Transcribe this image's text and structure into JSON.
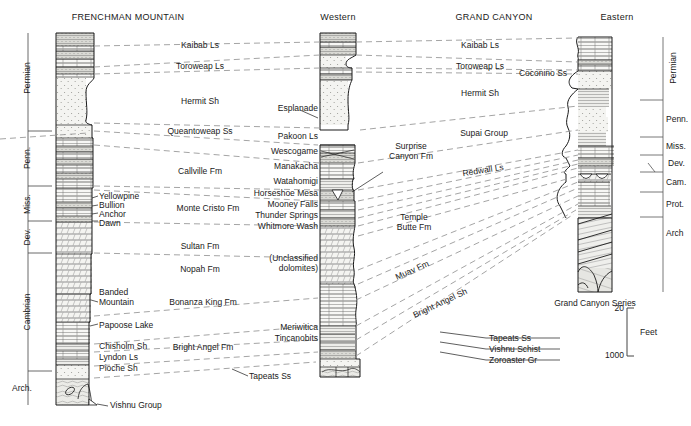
{
  "figure": {
    "type": "stratigraphic-correlation-diagram",
    "title_left": "FRENCHMAN MOUNTAIN",
    "title_center": "GRAND CANYON",
    "subtitle_western": "Western",
    "subtitle_eastern": "Eastern",
    "caption_eastern_column": "Grand Canyon Series"
  },
  "scale": {
    "top_value": "20",
    "bottom_value": "1000",
    "unit_label": "Feet"
  },
  "left_periods": [
    {
      "label": "Permian"
    },
    {
      "label": "Penn."
    },
    {
      "label": "Miss."
    },
    {
      "label": "Dev."
    },
    {
      "label": "Cambrian"
    },
    {
      "label": "Arch."
    }
  ],
  "right_periods": [
    {
      "label": "Permian"
    },
    {
      "label": "Penn."
    },
    {
      "label": "Miss."
    },
    {
      "label": "Dev."
    },
    {
      "label": "Cam."
    },
    {
      "label": "Prot."
    },
    {
      "label": "Arch"
    }
  ],
  "frenchman_units": [
    {
      "label": "Yellowpine"
    },
    {
      "label": "Bullion"
    },
    {
      "label": "Anchor"
    },
    {
      "label": "Dawn"
    },
    {
      "label": "Banded\nMountain"
    },
    {
      "label": "Papoose Lake"
    },
    {
      "label": "Chisholm Sh"
    },
    {
      "label": "Lyndon Ls"
    },
    {
      "label": "Pioche Sh"
    }
  ],
  "frenchman_formations": [
    {
      "label": "Kaibab Ls"
    },
    {
      "label": "Toroweap Ls"
    },
    {
      "label": "Hermit Sh"
    },
    {
      "label": "Queantoweap Ss"
    },
    {
      "label": "Callville Fm"
    },
    {
      "label": "Monte Cristo Fm"
    },
    {
      "label": "Sultan Fm"
    },
    {
      "label": "Nopah Fm"
    },
    {
      "label": "Bonanza King Fm"
    },
    {
      "label": "Bright Angel Fm"
    },
    {
      "label": "Tapeats Ss"
    },
    {
      "label": "Vishnu Group"
    }
  ],
  "western_units": [
    {
      "label": "Esplanade"
    },
    {
      "label": "Pakoon Ls"
    },
    {
      "label": "Wescogame"
    },
    {
      "label": "Manakacha"
    },
    {
      "label": "Watahomigi"
    },
    {
      "label": "Horseshoe Mesa"
    },
    {
      "label": "Mooney Falls"
    },
    {
      "label": "Thunder Springs"
    },
    {
      "label": "Whitmore Wash"
    },
    {
      "label": "(Unclassified\ndolomites)"
    },
    {
      "label": "Meriwitica"
    },
    {
      "label": "Tincanobits"
    }
  ],
  "grandcanyon_formations": [
    {
      "label": "Kaibab Ls"
    },
    {
      "label": "Toroweap Ls"
    },
    {
      "label": "Coconino Ss"
    },
    {
      "label": "Hermit Sh"
    },
    {
      "label": "Supai Group"
    },
    {
      "label": "Surprise\nCanyon Fm"
    },
    {
      "label": "Redwall Ls"
    },
    {
      "label": "Temple\nButte Fm"
    },
    {
      "label": "Muav Fm"
    },
    {
      "label": "Bright Angel Sh"
    },
    {
      "label": "Tapeats Ss"
    },
    {
      "label": "Vishnu Schist"
    },
    {
      "label": "Zoroaster Gr"
    }
  ],
  "colors": {
    "line": "#1a1a1a",
    "dashed_correlation": "#9a9a9a",
    "fill_light": "#f2f2f0",
    "fill_grey": "#d9d9d6",
    "background": "#ffffff"
  }
}
